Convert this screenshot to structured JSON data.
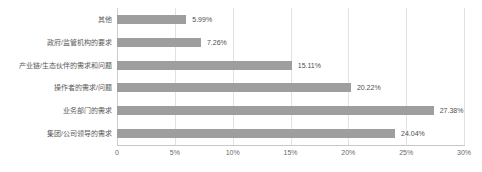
{
  "chart_data": {
    "type": "bar",
    "orientation": "horizontal",
    "title": "",
    "subtitle": "",
    "xlabel": "",
    "ylabel": "",
    "xlim": [
      0,
      30
    ],
    "grid": true,
    "legend": false,
    "bar_color": "#9e9e9e",
    "gridline_color": "#e2e2e2",
    "axis_color": "#c8c8c8",
    "label_color": "#5a5a5a",
    "value_color": "#4f4f4f",
    "tick_color": "#6a6a6a",
    "categories": [
      "其他",
      "政府/监管机构的要求",
      "产业链/生态伙伴的需求和问题",
      "操作者的需求/问题",
      "业务部门的需求",
      "集团/公司领导的需求"
    ],
    "values": [
      5.99,
      7.26,
      15.11,
      20.22,
      27.38,
      24.04
    ],
    "value_labels": [
      "5.99%",
      "7.26%",
      "15.11%",
      "20.22%",
      "27.38%",
      "24.04%"
    ],
    "xticks": [
      0,
      5,
      10,
      15,
      20,
      25,
      30
    ],
    "xtick_labels": [
      "0",
      "5%",
      "10%",
      "15%",
      "20%",
      "25%",
      "30%"
    ]
  },
  "caption": {
    "text": ""
  }
}
